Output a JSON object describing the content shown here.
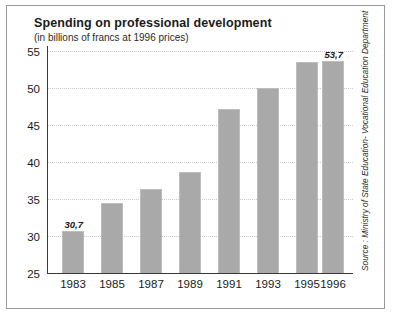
{
  "chart_data": {
    "type": "bar",
    "title": "Spending on professional development",
    "subtitle": "(in billions of francs at 1996 prices)",
    "xlabel": "",
    "ylabel": "",
    "categories": [
      "1983",
      "1985",
      "1987",
      "1989",
      "1991",
      "1993",
      "1995",
      "1996"
    ],
    "values": [
      30.7,
      34.4,
      36.3,
      38.7,
      47.2,
      50.0,
      53.5,
      53.7
    ],
    "value_labels": [
      "30,7",
      "",
      "",
      "",
      "",
      "",
      "",
      "53,7"
    ],
    "ylim": [
      25,
      55
    ],
    "y_ticks": [
      55,
      50,
      45,
      40,
      35,
      30,
      25
    ],
    "y_tick_labels": [
      "55",
      "50",
      "45",
      "40",
      "35",
      "30",
      "25"
    ],
    "grid": true,
    "legend": "none",
    "source": "Source : Ministry of State Education- Vocational Education Department",
    "bar_color": "#a9a9a9",
    "axis_color": "#3a3a3a",
    "grid_color": "#c9c9c9",
    "frame_color": "#9a9a9a",
    "text_color": "#1b1b1b"
  }
}
